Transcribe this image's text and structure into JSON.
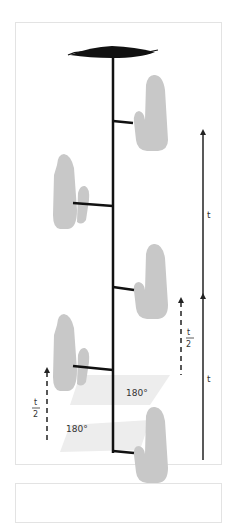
{
  "diagram": {
    "type": "rotating-hand-pendulum",
    "labels": {
      "t_long_upper": "t",
      "t_long_lower": "t",
      "half_t_right_numerator": "t",
      "half_t_right_denominator": "2",
      "half_t_left_numerator": "t",
      "half_t_left_denominator": "2",
      "angle_upper": "180°",
      "angle_lower": "180°"
    },
    "colors": {
      "shaft": "#111111",
      "hand": "#c8c8c8",
      "hand_shade": "#b8b8b8",
      "rotation_plane": "#ececec",
      "arrow": "#222222",
      "border": "#e3e3e3"
    },
    "elements": {
      "eye": "eye-shape-top",
      "hands": [
        "hand-1-right",
        "hand-2-left",
        "hand-3-right",
        "hand-4-left",
        "hand-5-right"
      ]
    }
  }
}
